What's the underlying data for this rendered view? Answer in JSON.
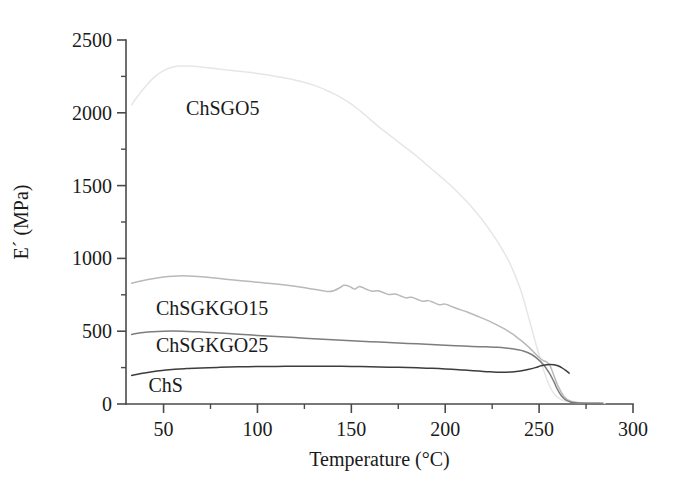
{
  "chart_data": {
    "type": "line",
    "title": "",
    "xlabel": "Temperature (°C)",
    "ylabel": "E´ (MPa)",
    "xlim": [
      30,
      300
    ],
    "ylim": [
      0,
      2500
    ],
    "xticks": [
      50,
      100,
      150,
      200,
      250,
      300
    ],
    "xtick_labels": [
      "50",
      "100",
      "150",
      "200",
      "250",
      "300"
    ],
    "xminor_step": 25,
    "yticks": [
      0,
      500,
      1000,
      1500,
      2000,
      2500
    ],
    "ytick_labels": [
      "0",
      "500",
      "1000",
      "1500",
      "2000",
      "2500"
    ],
    "yminor_step": 250,
    "grid": false,
    "legend_position": "inline-annotations",
    "series": [
      {
        "name": "ChSGO5",
        "color": "#e6e6e6",
        "label_x": 62,
        "label_y": 2030,
        "x": [
          33,
          36,
          40,
          45,
          50,
          55,
          60,
          65,
          70,
          80,
          90,
          100,
          110,
          120,
          130,
          140,
          145,
          150,
          155,
          160,
          165,
          170,
          175,
          180,
          185,
          190,
          195,
          200,
          205,
          210,
          215,
          220,
          225,
          230,
          235,
          240,
          243,
          246,
          249,
          252,
          255,
          258,
          262,
          268,
          275,
          285
        ],
        "y": [
          2055,
          2110,
          2175,
          2245,
          2290,
          2315,
          2322,
          2320,
          2315,
          2300,
          2285,
          2270,
          2250,
          2225,
          2190,
          2135,
          2100,
          2060,
          2010,
          1955,
          1900,
          1850,
          1800,
          1750,
          1700,
          1645,
          1590,
          1535,
          1475,
          1410,
          1340,
          1260,
          1170,
          1070,
          950,
          790,
          660,
          520,
          380,
          250,
          140,
          70,
          28,
          12,
          8,
          6
        ]
      },
      {
        "name": "ChSGKGO15",
        "color": "#b9b9b9",
        "label_x": 46,
        "label_y": 660,
        "x": [
          33,
          38,
          44,
          50,
          55,
          60,
          66,
          72,
          80,
          90,
          100,
          110,
          120,
          128,
          134,
          138,
          141,
          144,
          146,
          148,
          150,
          152,
          154,
          156,
          158,
          161,
          164,
          167,
          170,
          173,
          176,
          179,
          182,
          185,
          188,
          191,
          194,
          197,
          200,
          204,
          208,
          212,
          216,
          220,
          224,
          228,
          232,
          236,
          240,
          243,
          246,
          248,
          250,
          252,
          254,
          256,
          258,
          261,
          265,
          272,
          282
        ],
        "y": [
          830,
          845,
          860,
          872,
          878,
          880,
          878,
          872,
          862,
          848,
          836,
          824,
          808,
          792,
          780,
          772,
          780,
          800,
          815,
          812,
          800,
          790,
          806,
          800,
          788,
          775,
          778,
          766,
          752,
          756,
          744,
          730,
          733,
          720,
          706,
          710,
          696,
          682,
          686,
          666,
          648,
          630,
          610,
          588,
          566,
          540,
          512,
          480,
          440,
          408,
          372,
          345,
          320,
          300,
          288,
          258,
          190,
          100,
          30,
          8,
          6
        ]
      },
      {
        "name": "ChSGKGO25",
        "color": "#7d7d7d",
        "label_x": 46,
        "label_y": 405,
        "x": [
          33,
          38,
          44,
          50,
          55,
          60,
          66,
          72,
          80,
          90,
          100,
          110,
          120,
          130,
          140,
          150,
          160,
          170,
          180,
          190,
          200,
          210,
          218,
          226,
          232,
          238,
          242,
          246,
          249,
          252,
          254,
          256,
          258,
          260,
          263,
          267,
          274,
          284
        ],
        "y": [
          478,
          489,
          496,
          500,
          501,
          500,
          497,
          493,
          487,
          479,
          471,
          463,
          456,
          448,
          441,
          434,
          428,
          422,
          416,
          410,
          404,
          398,
          394,
          390,
          385,
          374,
          362,
          340,
          312,
          275,
          240,
          200,
          150,
          95,
          40,
          12,
          6,
          5
        ]
      },
      {
        "name": "ChS",
        "color": "#3c3c3c",
        "label_x": 42,
        "label_y": 132,
        "x": [
          33,
          38,
          44,
          50,
          56,
          62,
          70,
          80,
          90,
          100,
          110,
          120,
          130,
          140,
          150,
          160,
          170,
          180,
          190,
          200,
          210,
          218,
          224,
          230,
          235,
          240,
          244,
          248,
          251,
          254,
          256,
          258,
          260,
          262,
          264,
          266
        ],
        "y": [
          196,
          210,
          222,
          231,
          238,
          243,
          248,
          252,
          255,
          257,
          258,
          259,
          259,
          259,
          258,
          256,
          253,
          250,
          246,
          241,
          233,
          226,
          221,
          218,
          220,
          226,
          237,
          250,
          262,
          270,
          272,
          270,
          263,
          250,
          232,
          212
        ]
      }
    ]
  },
  "figure": {
    "background": "#ffffff",
    "axis_color": "#4a4a4a",
    "text_color": "#1a1a1a"
  }
}
